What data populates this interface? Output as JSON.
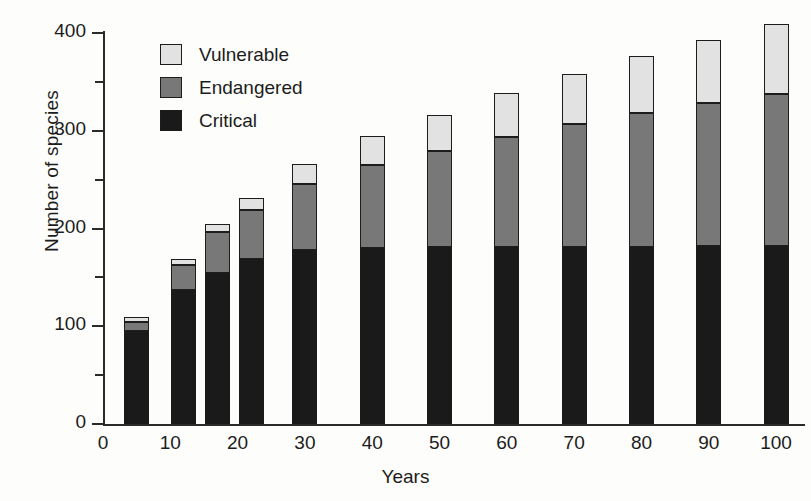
{
  "chart_data": {
    "type": "bar",
    "subtype": "stacked-vertical",
    "title": "",
    "xlabel": "Years",
    "ylabel": "Number of species",
    "xlim": [
      0,
      104
    ],
    "ylim": [
      0,
      400
    ],
    "grid": false,
    "legend_position": "top-left",
    "x_major_ticks": [
      0,
      10,
      20,
      30,
      40,
      50,
      60,
      70,
      80,
      90,
      100
    ],
    "x_tick_labels": [
      "0",
      "10",
      "20",
      "30",
      "40",
      "50",
      "60",
      "70",
      "80",
      "90",
      "100"
    ],
    "y_major_ticks": [
      0,
      100,
      200,
      300,
      400
    ],
    "y_minor_ticks": [
      50,
      150,
      250,
      350
    ],
    "y_tick_labels": [
      "0",
      "100",
      "200",
      "300",
      "400"
    ],
    "x": [
      5,
      12,
      17,
      22,
      30,
      40,
      50,
      60,
      70,
      80,
      90,
      100
    ],
    "series": [
      {
        "name": "Critical",
        "color": "#1a1a1a",
        "values": [
          95,
          137,
          155,
          169,
          178,
          180,
          181,
          181,
          181,
          181,
          182,
          182
        ]
      },
      {
        "name": "Endangered",
        "color": "#787878",
        "values": [
          9,
          26,
          41,
          50,
          68,
          85,
          98,
          113,
          126,
          137,
          146,
          156
        ]
      },
      {
        "name": "Vulnerable",
        "color": "#e2e2e2",
        "values": [
          5,
          6,
          9,
          12,
          20,
          30,
          37,
          45,
          51,
          58,
          65,
          71
        ]
      }
    ],
    "cumulative_tops": {
      "critical": [
        95,
        137,
        155,
        169,
        178,
        180,
        181,
        181,
        181,
        181,
        182,
        182
      ],
      "endangered": [
        104,
        163,
        196,
        219,
        246,
        265,
        279,
        294,
        307,
        318,
        328,
        338
      ],
      "vulnerable": [
        109,
        169,
        205,
        231,
        266,
        295,
        316,
        339,
        358,
        376,
        393,
        409
      ]
    }
  },
  "legend": {
    "items": [
      {
        "label": "Vulnerable",
        "color": "#e2e2e2"
      },
      {
        "label": "Endangered",
        "color": "#787878"
      },
      {
        "label": "Critical",
        "color": "#1a1a1a"
      }
    ]
  }
}
